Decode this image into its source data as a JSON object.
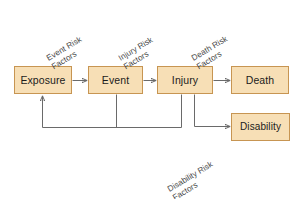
{
  "diagram": {
    "colors": {
      "node_fill": "#F7DFB6",
      "node_border": "#C79552",
      "wire": "#6A6A6A",
      "label_text": "#4A4A4A",
      "node_text": "#1B1B1B",
      "background": "#FFFFFF"
    },
    "nodes": [
      {
        "id": "exposure",
        "label": "Exposure"
      },
      {
        "id": "event",
        "label": "Event"
      },
      {
        "id": "injury",
        "label": "Injury"
      },
      {
        "id": "death",
        "label": "Death"
      },
      {
        "id": "disability",
        "label": "Disability"
      }
    ],
    "edge_labels": [
      {
        "id": "event-risk-factors",
        "line1": "Event Risk",
        "line2": "Factors"
      },
      {
        "id": "injury-risk-factors",
        "line1": "Injury Risk",
        "line2": "Factors"
      },
      {
        "id": "death-risk-factors",
        "line1": "Death Risk",
        "line2": "Factors"
      },
      {
        "id": "disability-risk-factors",
        "line1": "Disability Risk",
        "line2": "Factors"
      }
    ],
    "edges": [
      {
        "id": "exposure-to-event",
        "from": "Exposure",
        "to": "Event"
      },
      {
        "id": "event-to-injury",
        "from": "Event",
        "to": "Injury"
      },
      {
        "id": "injury-to-death",
        "from": "Injury",
        "to": "Death"
      },
      {
        "id": "injury-to-disability",
        "from": "Injury",
        "to": "Disability"
      },
      {
        "id": "event-feedback-exposure",
        "from": "Event",
        "to": "Exposure"
      },
      {
        "id": "injury-feedback-exposure",
        "from": "Injury",
        "to": "Exposure"
      }
    ]
  }
}
